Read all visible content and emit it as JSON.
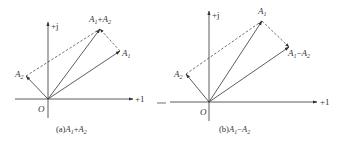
{
  "diagrams": [
    {
      "id": "a",
      "caption_prefix": "(a)",
      "caption_expr": {
        "a": "A",
        "a_sub": "1",
        "op": "+",
        "b": "A",
        "b_sub": "2"
      },
      "axes": {
        "imag_label": "+j",
        "real_label": "+1",
        "origin_label": "O"
      },
      "vectors": [
        {
          "name": "A1",
          "label": "A",
          "sub": "1"
        },
        {
          "name": "A2",
          "label": "A",
          "sub": "2"
        },
        {
          "name": "A1+A2",
          "label_a": "A",
          "sub_a": "1",
          "op": "+",
          "label_b": "A",
          "sub_b": "2"
        }
      ]
    },
    {
      "id": "b",
      "caption_prefix": "(b)",
      "caption_expr": {
        "a": "A",
        "a_sub": "1",
        "op": "−",
        "b": "A",
        "b_sub": "2"
      },
      "axes": {
        "imag_label": "+j",
        "real_label": "+1",
        "origin_label": "O"
      },
      "vectors": [
        {
          "name": "A1",
          "label": "A",
          "sub": "1"
        },
        {
          "name": "A2",
          "label": "A",
          "sub": "2"
        },
        {
          "name": "A1-A2",
          "label_a": "A",
          "sub_a": "1",
          "op": "−",
          "label_b": "A",
          "sub_b": "2"
        }
      ]
    }
  ],
  "colors": {
    "line": "#333333",
    "background": "#ffffff"
  }
}
